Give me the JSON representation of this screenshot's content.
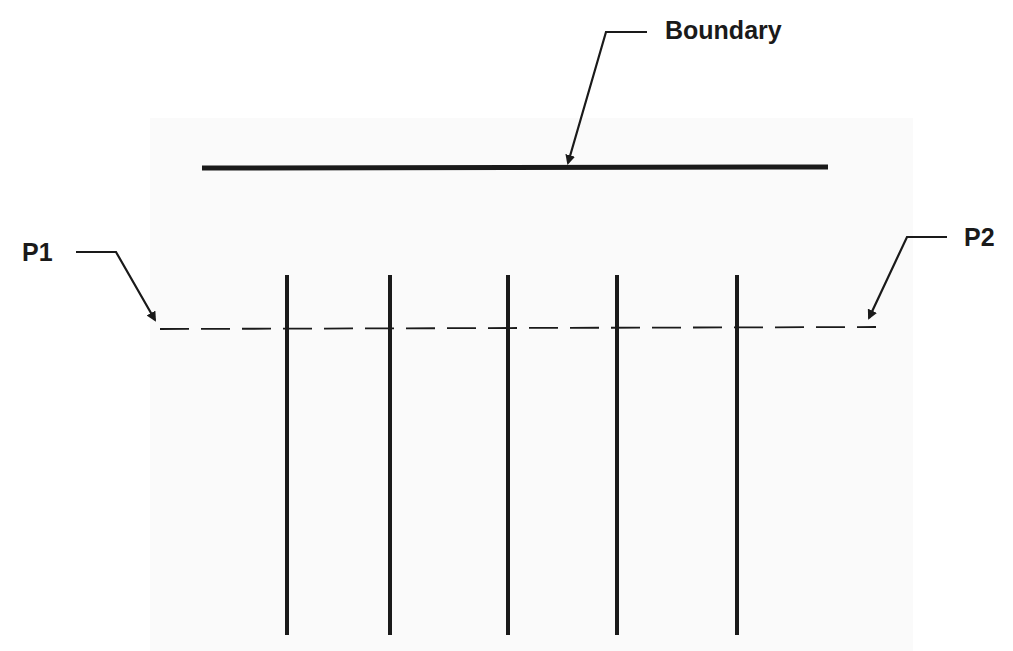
{
  "diagram": {
    "labels": {
      "boundary": "Boundary",
      "p1": "P1",
      "p2": "P2"
    },
    "colors": {
      "line": "#1a1a1a",
      "background": "#ffffff"
    },
    "boundary_line": {
      "x1": 202,
      "y1": 168,
      "x2": 828,
      "y2": 167
    },
    "dashed_line": {
      "x1": 160,
      "y1": 329,
      "x2": 876,
      "y2": 327
    },
    "vertical_lines_x": [
      287,
      390,
      508,
      617,
      737
    ],
    "vertical_lines_y_range": [
      275,
      635
    ]
  }
}
